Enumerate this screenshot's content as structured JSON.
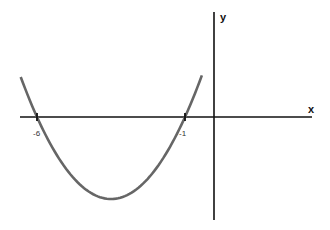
{
  "chart_data": {
    "type": "line",
    "title": "",
    "xlabel": "x",
    "ylabel": "y",
    "function": "y = (x + 6)(x + 1)",
    "roots": [
      -6,
      -1
    ],
    "vertex": {
      "x": -3.5,
      "y": -6.25
    },
    "tick_labels": [
      "-6",
      "-1"
    ],
    "grid": false,
    "legend": null,
    "colors": {
      "curve": "#666666",
      "axes": "#111111"
    }
  },
  "labels": {
    "x_axis": "x",
    "y_axis": "y",
    "tick_a": "-6",
    "tick_b": "-1"
  }
}
